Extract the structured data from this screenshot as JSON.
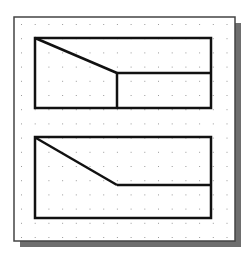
{
  "colors": {
    "background": "#ffffff",
    "frame_border": "#444444",
    "shadow": "#6e6e6e",
    "line": "#111111",
    "grid_dot": "#9a9a9a"
  },
  "frame": {
    "x": 14,
    "y": 17,
    "w": 221,
    "h": 224,
    "shadow_offset": 6
  },
  "grid": {
    "x0": 21,
    "y0": 24,
    "dx": 13.7,
    "dy": 14.2,
    "cols": 16,
    "rows": 16
  },
  "figures": [
    {
      "name": "top-view",
      "rect": {
        "x": 35,
        "y": 38,
        "w": 176,
        "h": 70
      },
      "lines": [
        [
          35,
          38,
          117,
          73
        ],
        [
          117,
          73,
          211,
          73
        ],
        [
          117,
          73,
          117,
          108
        ]
      ]
    },
    {
      "name": "front-view",
      "rect": {
        "x": 35,
        "y": 137,
        "w": 176,
        "h": 81
      },
      "lines": [
        [
          36,
          138,
          117,
          185
        ],
        [
          117,
          185,
          211,
          185
        ]
      ]
    }
  ]
}
